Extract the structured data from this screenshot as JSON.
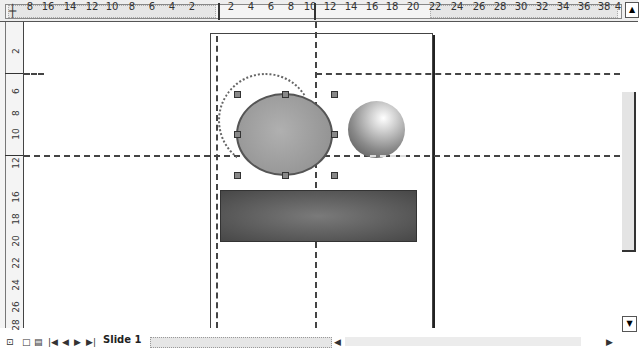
{
  "ruler_horizontal": {
    "corner_icon": "┼",
    "ticks_left": [
      "8",
      "16",
      "14",
      "12",
      "10",
      "8",
      "6",
      "4",
      "2"
    ],
    "ticks_right": [
      "2",
      "4",
      "6",
      "8",
      "10",
      "12",
      "14",
      "16",
      "18",
      "20",
      "22",
      "24",
      "26",
      "28",
      "30",
      "32",
      "34",
      "36",
      "38",
      "4"
    ]
  },
  "ruler_vertical": {
    "ticks": [
      "2",
      "6",
      "8",
      "10",
      "12",
      "16",
      "18",
      "20",
      "22",
      "24",
      "26",
      "28"
    ]
  },
  "canvas": {
    "shapes": [
      {
        "type": "ellipse",
        "label": "Selected ellipse",
        "fill": "#9e9e9e"
      },
      {
        "type": "sphere",
        "label": "Gradient sphere"
      },
      {
        "type": "rectangle",
        "label": "Gradient rectangle",
        "fill": "#5a5a5a"
      }
    ]
  },
  "scroll": {
    "up_arrow": "▲",
    "down_arrow": "▼",
    "left_arrow": "◀",
    "right_arrow": "▶"
  },
  "bottom_bar": {
    "view_buttons": [
      "⊡",
      "□",
      "▤"
    ],
    "nav_buttons": [
      "|◀",
      "◀",
      "▶",
      "▶|"
    ],
    "tab_label": "Slide 1"
  }
}
